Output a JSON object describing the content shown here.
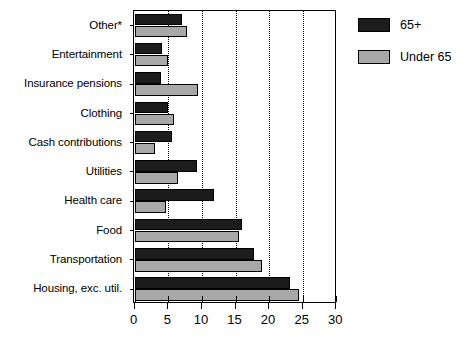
{
  "chart_data": {
    "type": "bar",
    "orientation": "horizontal",
    "title": "",
    "subtitle": "",
    "xlabel": "",
    "ylabel": "",
    "xlim": [
      0,
      30
    ],
    "xticks": [
      0,
      5,
      10,
      15,
      20,
      25,
      30
    ],
    "xtick_labels": [
      "0",
      "5",
      "10",
      "15",
      "20",
      "25",
      "30"
    ],
    "grid": "vertical dotted gridlines at 5,10,15,20,25",
    "gridlines": [
      5,
      10,
      15,
      20,
      25
    ],
    "legend_position": "right",
    "categories": [
      "Other*",
      "Entertainment",
      "Insurance pensions",
      "Clothing",
      "Cash contributions",
      "Utilities",
      "Health care",
      "Food",
      "Transportation",
      "Housing, exc. util."
    ],
    "series": [
      {
        "name": "65+",
        "color": "#1c1c1c",
        "values": [
          7.1,
          4.1,
          3.9,
          4.9,
          5.5,
          9.3,
          11.8,
          16.0,
          17.7,
          23.1
        ]
      },
      {
        "name": "Under 65",
        "color": "#a8a8a8",
        "values": [
          7.8,
          5.0,
          9.4,
          5.8,
          3.0,
          6.4,
          4.6,
          15.5,
          19.0,
          24.5
        ]
      }
    ]
  },
  "legend": {
    "entries": [
      {
        "label": "65+",
        "color": "#1c1c1c"
      },
      {
        "label": "Under 65",
        "color": "#a8a8a8"
      }
    ]
  },
  "colors": {
    "series_65plus": "#1c1c1c",
    "series_under65": "#a8a8a8",
    "axis": "#000000",
    "background": "#ffffff"
  }
}
